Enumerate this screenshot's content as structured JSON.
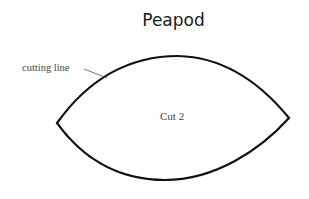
{
  "diagram": {
    "title": "Peapod",
    "annotation": "cutting line",
    "center_label": "Cut 2",
    "shape": {
      "type": "pointed-oval",
      "left_tip": [
        57,
        123
      ],
      "right_tip": [
        289,
        118
      ],
      "top_apex": [
        175,
        56
      ],
      "bottom_apex": [
        165,
        180
      ],
      "stroke": "#111111"
    }
  }
}
